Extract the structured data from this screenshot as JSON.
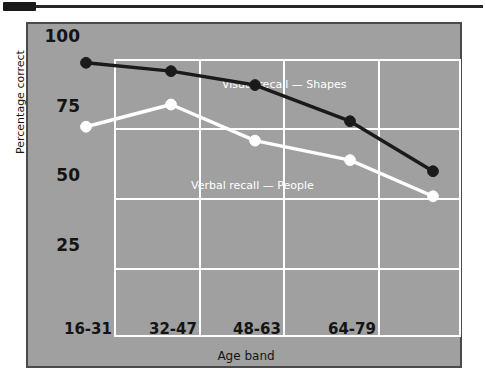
{
  "header": {
    "swatch_name": "page-marker-swatch",
    "rule_name": "header-rule"
  },
  "chart_data": {
    "type": "line",
    "title": "",
    "xlabel": "Age band",
    "ylabel": "Percentage correct",
    "categories": [
      "16-31",
      "32-47",
      "48-63",
      "64-79",
      ""
    ],
    "x_tick_labels": [
      "16-31",
      "32-47",
      "48-63",
      "64-79"
    ],
    "y_tick_labels": [
      "100",
      "75",
      "50",
      "25"
    ],
    "y_ticks": [
      100,
      75,
      50,
      25
    ],
    "ylim": [
      0,
      100
    ],
    "grid": true,
    "legend_position": "inline-annotations",
    "series": [
      {
        "name": "Visual recall — Shapes",
        "color": "#1a1a1a",
        "marker": "filled-circle",
        "values": [
          90,
          87,
          82,
          69,
          51
        ]
      },
      {
        "name": "Verbal recall — People",
        "color": "#ffffff",
        "marker": "open-circle",
        "values": [
          67,
          75,
          62,
          55,
          42
        ]
      }
    ],
    "annotations": [
      {
        "text": "Visual recall — Shapes",
        "color": "#ffffff"
      },
      {
        "text": "Verbal recall — People",
        "color": "#ffffff"
      }
    ],
    "colors": {
      "panel_background": "#a0a0a0",
      "panel_border": "#4a4a4a",
      "gridline": "#ffffff",
      "tick_text": "#141414",
      "series_dark": "#1a1a1a",
      "series_light": "#ffffff"
    }
  }
}
